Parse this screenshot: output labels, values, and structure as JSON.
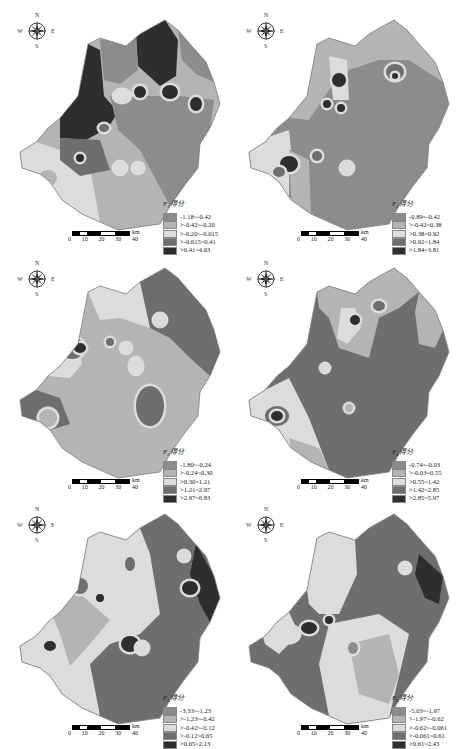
{
  "figure": {
    "compass": {
      "north": "N",
      "south": "S",
      "east": "E",
      "west": "W"
    },
    "scale_bar": {
      "ticks": [
        "0",
        "10",
        "20",
        "30",
        "40"
      ],
      "unit": "km"
    },
    "palette": [
      "#8c8c8c",
      "#b4b4b4",
      "#dcdcdc",
      "#6e6e6e",
      "#2e2e2e"
    ],
    "panels": [
      {
        "id": "F1",
        "legend_title_main": "F",
        "legend_title_sub": "1",
        "legend_title_suffix": "得分",
        "classes": [
          "-1.18~-0.42",
          ">-0.42~-0.20",
          ">-0.20~-0.015",
          ">-0.015~0.41",
          ">0.41~4.03"
        ]
      },
      {
        "id": "F2",
        "legend_title_main": "F",
        "legend_title_sub": "2",
        "legend_title_suffix": "得分",
        "classes": [
          "-0.89~-0.42",
          ">-0.42~0.38",
          ">0.38~0.92",
          ">0.92~1.84",
          ">1.84~3.81"
        ]
      },
      {
        "id": "F3",
        "legend_title_main": "F",
        "legend_title_sub": "3",
        "legend_title_suffix": "得分",
        "classes": [
          "-1.80~-0.24",
          ">-0.24~0.30",
          ">0.30~1.21",
          ">1.21~2.97",
          ">2.97~6.83"
        ]
      },
      {
        "id": "F4",
        "legend_title_main": "F",
        "legend_title_sub": "4",
        "legend_title_suffix": "得分",
        "classes": [
          "-0.74~-0.03",
          ">-0.03~0.55",
          ">0.55~1.42",
          ">1.42~2.85",
          ">2.85~5.97"
        ]
      },
      {
        "id": "F5",
        "legend_title_main": "F",
        "legend_title_sub": "5",
        "legend_title_suffix": "得分",
        "classes": [
          "-3.33~-1.23",
          ">-1.23~-0.42",
          ">-0.42~-0.12",
          ">-0.12~0.65",
          ">0.65~2.13"
        ]
      },
      {
        "id": "F6",
        "legend_title_main": "F",
        "legend_title_sub": "6",
        "legend_title_suffix": "得分",
        "classes": [
          "-5.03~-1.97",
          ">-1.97~-0.62",
          ">-0.62~-0.061",
          ">-0.061~0.61",
          ">0.61~2.43"
        ]
      }
    ]
  }
}
